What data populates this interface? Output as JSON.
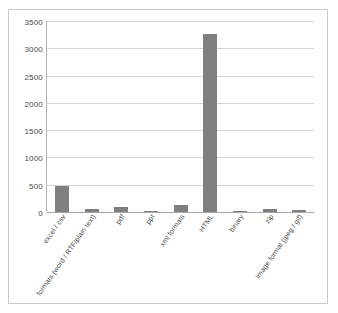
{
  "chart_data": {
    "type": "bar",
    "title": "",
    "subtitle": "",
    "xlabel": "",
    "ylabel": "",
    "ylim": [
      0,
      3500
    ],
    "yticks": [
      0,
      500,
      1000,
      1500,
      2000,
      2500,
      3000,
      3500
    ],
    "ytick_labels": [
      "0",
      "500",
      "1000",
      "1500",
      "2000",
      "2500",
      "3000",
      "3500"
    ],
    "grid": true,
    "legend": false,
    "categories": [
      "excel / csv",
      "formats (word / RTF/plain text)",
      "pdf",
      "ppt",
      "xml formats",
      "HTML",
      "binary",
      "zip",
      "image format (jpeg / gif)"
    ],
    "values": [
      480,
      60,
      100,
      25,
      120,
      3270,
      25,
      50,
      30
    ],
    "bar_color": "#7f7f7f",
    "gridline_color": "#d4d4d4",
    "axis_color": "#a8a8a8",
    "frame_color": "#c9c9c9",
    "background": "#ffffff"
  }
}
